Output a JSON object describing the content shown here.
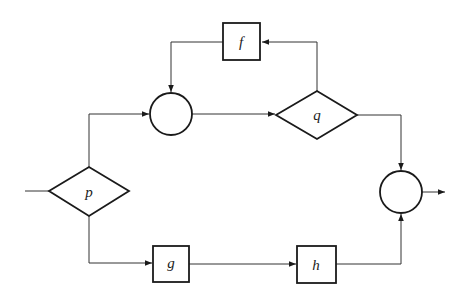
{
  "diagram": {
    "type": "flowchart",
    "nodes": {
      "p": {
        "shape": "diamond",
        "label": "p"
      },
      "q": {
        "shape": "diamond",
        "label": "q"
      },
      "f": {
        "shape": "box",
        "label": "f"
      },
      "g": {
        "shape": "box",
        "label": "g"
      },
      "h": {
        "shape": "box",
        "label": "h"
      },
      "junction_top": {
        "shape": "circle",
        "label": ""
      },
      "junction_out": {
        "shape": "circle",
        "label": ""
      }
    },
    "edges": [
      {
        "from": "input",
        "to": "p"
      },
      {
        "from": "p",
        "to": "junction_top"
      },
      {
        "from": "p",
        "to": "g"
      },
      {
        "from": "junction_top",
        "to": "q"
      },
      {
        "from": "q",
        "to": "f"
      },
      {
        "from": "f",
        "to": "junction_top"
      },
      {
        "from": "q",
        "to": "junction_out"
      },
      {
        "from": "g",
        "to": "h"
      },
      {
        "from": "h",
        "to": "junction_out"
      },
      {
        "from": "junction_out",
        "to": "output"
      }
    ],
    "colors": {
      "stroke": "#1a1a1a",
      "background": "#ffffff"
    }
  }
}
